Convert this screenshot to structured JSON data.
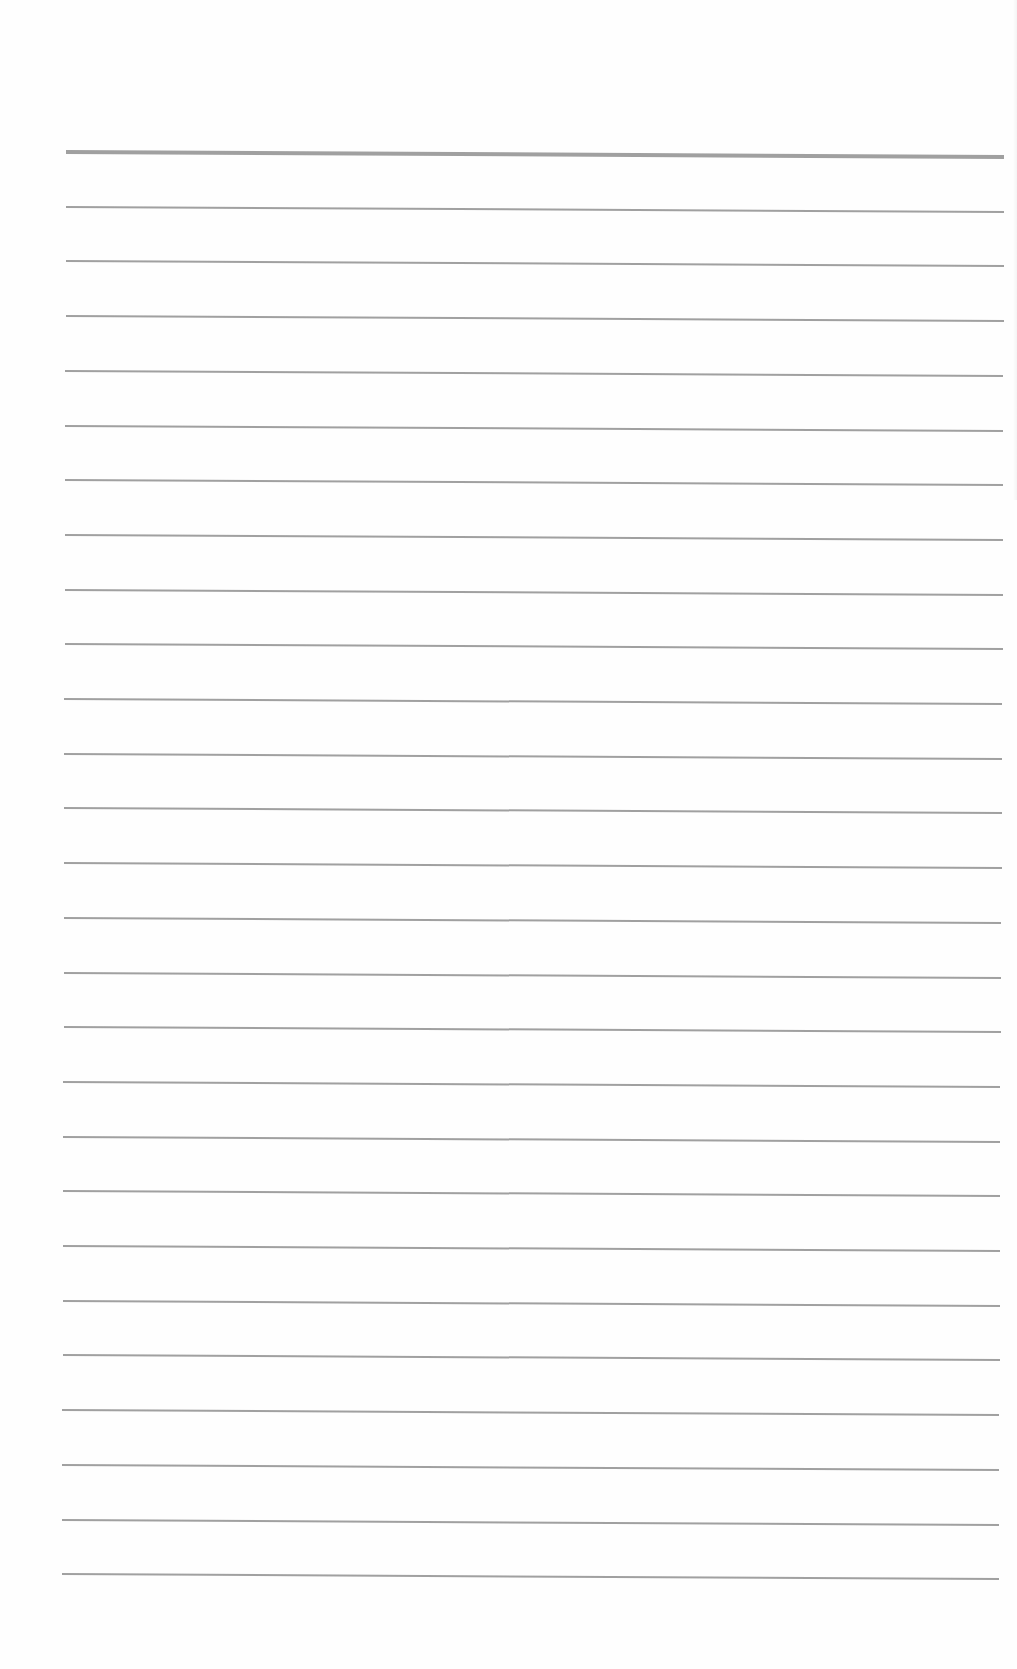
{
  "document": {
    "type": "lined-paper",
    "background_color": "#fefefe",
    "line_color": "#8f8f8f",
    "line_count": 27,
    "header_line_index": 0,
    "line_spacing_px": 54.7,
    "first_line_left_y": 152,
    "left_x_top": 66,
    "left_x_bottom": 62,
    "right_x_top": 1004,
    "right_x_bottom": 999,
    "tilt_drop_px": 5
  }
}
